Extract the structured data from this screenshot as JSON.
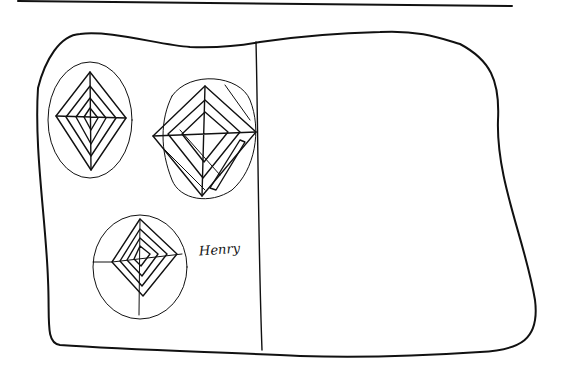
{
  "sketch": {
    "annotation_label": "Henry",
    "ink_color": "#111111",
    "background_color": "#ffffff",
    "panels": [
      {
        "id": "left",
        "diagrams": 3
      },
      {
        "id": "right",
        "diagrams": 3
      }
    ]
  }
}
